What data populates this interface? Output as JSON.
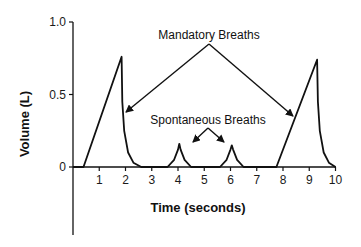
{
  "chart_data": {
    "type": "line",
    "title": "",
    "xlabel": "Time (seconds)",
    "ylabel": "Volume (L)",
    "xlim": [
      0,
      10
    ],
    "ylim": [
      0,
      1.0
    ],
    "grid": false,
    "legend": null,
    "x_ticks": [
      "1",
      "2",
      "3",
      "4",
      "5",
      "6",
      "7",
      "8",
      "9",
      "10"
    ],
    "y_ticks": [
      "0",
      "0.5",
      "1.0"
    ],
    "series": [
      {
        "name": "Volume waveform",
        "points": [
          [
            0,
            0
          ],
          [
            0.4,
            0
          ],
          [
            1.85,
            0.76
          ],
          [
            1.88,
            0.45
          ],
          [
            1.95,
            0.25
          ],
          [
            2.1,
            0.1
          ],
          [
            2.3,
            0.03
          ],
          [
            2.6,
            0
          ],
          [
            3.6,
            0
          ],
          [
            3.85,
            0.05
          ],
          [
            4.0,
            0.12
          ],
          [
            4.05,
            0.16
          ],
          [
            4.1,
            0.12
          ],
          [
            4.25,
            0.05
          ],
          [
            4.5,
            0
          ],
          [
            5.6,
            0
          ],
          [
            5.85,
            0.05
          ],
          [
            6.0,
            0.12
          ],
          [
            6.05,
            0.15
          ],
          [
            6.1,
            0.12
          ],
          [
            6.25,
            0.05
          ],
          [
            6.5,
            0
          ],
          [
            7.75,
            0
          ],
          [
            9.3,
            0.74
          ],
          [
            9.33,
            0.45
          ],
          [
            9.4,
            0.25
          ],
          [
            9.55,
            0.1
          ],
          [
            9.75,
            0.03
          ],
          [
            10.0,
            0
          ]
        ]
      }
    ],
    "annotations": [
      {
        "text": "Mandatory Breaths",
        "arrows_to": [
          [
            1.95,
            0.38
          ],
          [
            8.35,
            0.35
          ]
        ]
      },
      {
        "text": "Spontaneous Breaths",
        "arrows_to": [
          [
            4.55,
            0.17
          ],
          [
            5.75,
            0.17
          ]
        ]
      }
    ]
  },
  "labels": {
    "xlabel": "Time (seconds)",
    "ylabel": "Volume (L)",
    "annotation_mandatory": "Mandatory Breaths",
    "annotation_spontaneous": "Spontaneous Breaths"
  }
}
